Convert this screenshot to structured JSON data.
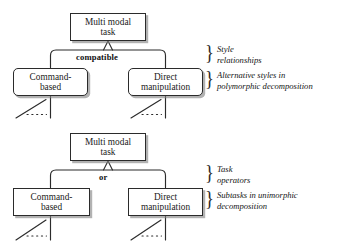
{
  "figure": {
    "background_color": "#ffffff",
    "line_color": "#2b2b2b",
    "text_color": "#1a1a1a",
    "shadow_color": "#828282"
  },
  "diagrams": [
    {
      "id": "polymorphic",
      "root": {
        "label": "Multi modal\ntask"
      },
      "connector_label": "compatible",
      "children": [
        {
          "label": "Command-\nbased",
          "shape": "rounded-rect"
        },
        {
          "label": "Direct\nmanipulation",
          "shape": "rounded-rect"
        }
      ],
      "annotations": [
        {
          "text": "Style\nrelationships"
        },
        {
          "text": "Alternative styles in\npolymorphic decomposition"
        }
      ],
      "brace_glyph": "}"
    },
    {
      "id": "unimorphic",
      "root": {
        "label": "Multi modal\ntask"
      },
      "connector_label": "or",
      "children": [
        {
          "label": "Command-\nbased",
          "shape": "rect"
        },
        {
          "label": "Direct\nmanipulation",
          "shape": "rect"
        }
      ],
      "annotations": [
        {
          "text": "Task\noperators"
        },
        {
          "text": "Subtasks in unimorphic\ndecomposition"
        }
      ],
      "brace_glyph": "}"
    }
  ]
}
